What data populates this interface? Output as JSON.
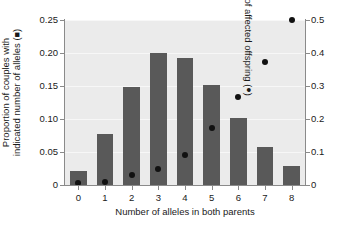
{
  "chart_data": {
    "type": "bar",
    "title": "",
    "xlabel": "Number of alleles in both parents",
    "categories": [
      "0",
      "1",
      "2",
      "3",
      "4",
      "5",
      "6",
      "7",
      "8"
    ],
    "grid": true,
    "legend_position": "in-axis-labels",
    "axes": {
      "left": {
        "label_line1": "Proportion of couples with",
        "label_line2": "indicated number of alleles (",
        "label_marker": "■",
        "label_close": ")",
        "ylim": [
          0,
          0.25
        ],
        "ticks": [
          0,
          0.05,
          0.1,
          0.15,
          0.2,
          0.25
        ],
        "ticklabels": [
          "0",
          "0.05",
          "0.10",
          "0.15",
          "0.20",
          "0.25"
        ]
      },
      "right": {
        "label": "Proportion of affected offspring (",
        "label_marker": "●",
        "label_close": ")",
        "ylim": [
          0,
          0.5
        ],
        "ticks": [
          0,
          0.1,
          0.2,
          0.3,
          0.4,
          0.5
        ],
        "ticklabels": [
          "0",
          "0.1",
          "0.2",
          "0.3",
          "0.4",
          "0.5"
        ]
      }
    },
    "series": [
      {
        "name": "Proportion of couples with indicated number of alleles",
        "marker": "square",
        "type": "bar",
        "axis": "left",
        "color": "#595959",
        "values": [
          0.021,
          0.078,
          0.149,
          0.2,
          0.193,
          0.152,
          0.101,
          0.058,
          0.029
        ]
      },
      {
        "name": "Proportion of affected offspring",
        "marker": "circle",
        "type": "scatter",
        "axis": "right",
        "color": "#111111",
        "values": [
          0.005,
          0.01,
          0.03,
          0.05,
          0.092,
          0.172,
          0.268,
          0.374,
          0.5
        ]
      }
    ]
  },
  "colors": {
    "bar": "#595959",
    "dot": "#111111",
    "plot_background": "#ebebeb",
    "gridline": "#f7f7f7",
    "axis": "#8a8a8a",
    "text": "#1a1a1a"
  }
}
